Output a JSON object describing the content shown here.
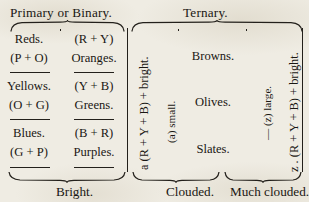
{
  "headers": {
    "primary_binary": "Primary or Binary.",
    "ternary": "Ternary."
  },
  "columns": {
    "primary": {
      "rows": [
        {
          "name": "Reds.",
          "formula": "(P + O)"
        },
        {
          "name": "Yellows.",
          "formula": "(O + G)"
        },
        {
          "name": "Blues.",
          "formula": "(G + P)"
        }
      ]
    },
    "binary": {
      "rows": [
        {
          "formula": "(R + Y)",
          "name": "Oranges."
        },
        {
          "formula": "(Y + B)",
          "name": "Greens."
        },
        {
          "formula": "(B + R)",
          "name": "Purples."
        }
      ]
    },
    "ternary": {
      "words": [
        "Browns.",
        "Olives.",
        "Slates."
      ]
    }
  },
  "vertical_labels": {
    "clouded_formula": "a (R + Y + B) + bright.",
    "clouded_qualifier": "(a) small.",
    "much_clouded_qualifier": "— (z) large.",
    "much_clouded_formula": "z . (R + Y + B) + bright."
  },
  "bottom_labels": {
    "bright": "Bright.",
    "clouded": "Clouded.",
    "much_clouded": "Much clouded."
  },
  "colors": {
    "ink": "#1a1713",
    "rule": "#23201b",
    "paper": "#efece3"
  }
}
